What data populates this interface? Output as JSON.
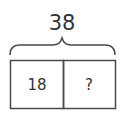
{
  "diagram": {
    "type": "tape-diagram",
    "total": "38",
    "parts": [
      {
        "label": "18"
      },
      {
        "label": "?"
      }
    ],
    "colors": {
      "stroke": "#4a4a4a",
      "text": "#333333",
      "background": "#ffffff"
    }
  }
}
